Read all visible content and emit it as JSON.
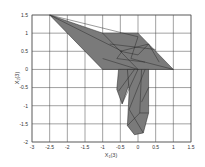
{
  "chart_data": {
    "type": "area",
    "title": "",
    "xlabel": "X1(3)",
    "ylabel": "X2(3)",
    "xlim": [
      -3,
      1.5
    ],
    "ylim": [
      -2,
      1.5
    ],
    "grid": true,
    "legend": "none",
    "x_ticks": [
      "-3",
      "-2.5",
      "-2",
      "-1.5",
      "-1",
      "-0.5",
      "0",
      "0.5",
      "1",
      "1.5"
    ],
    "y_ticks": [
      "1.5",
      "1",
      "0.5",
      "0",
      "-0.5",
      "-1",
      "-1.5",
      "-2"
    ],
    "fill_color": "#7a7a7a",
    "edge_color": "#222222",
    "regions": [
      {
        "name": "upper-wing",
        "points": [
          [
            -2.5,
            1.5
          ],
          [
            -1,
            1
          ],
          [
            0,
            1
          ],
          [
            1,
            0
          ],
          [
            -1,
            0
          ]
        ]
      },
      {
        "name": "lower-left-lobe",
        "points": [
          [
            -0.55,
            0
          ],
          [
            -0.1,
            0
          ],
          [
            -0.45,
            -0.95
          ],
          [
            -0.6,
            -0.55
          ]
        ]
      },
      {
        "name": "lower-right-lobe",
        "points": [
          [
            -0.3,
            0
          ],
          [
            0.3,
            0
          ],
          [
            0.3,
            -1.2
          ],
          [
            0.15,
            -1.75
          ],
          [
            -0.1,
            -1.8
          ],
          [
            -0.3,
            -1.55
          ],
          [
            -0.25,
            -0.6
          ]
        ]
      }
    ],
    "mesh_lines": [
      [
        [
          -2.5,
          1.5
        ],
        [
          0,
          0.9
        ]
      ],
      [
        [
          -2.5,
          1.5
        ],
        [
          -0.45,
          0.5
        ]
      ],
      [
        [
          -1,
          1
        ],
        [
          -0.5,
          0.5
        ]
      ],
      [
        [
          -0.5,
          0.5
        ],
        [
          0,
          0
        ]
      ],
      [
        [
          -0.8,
          0.7
        ],
        [
          0.5,
          0.55
        ]
      ],
      [
        [
          -0.5,
          0.5
        ],
        [
          0.3,
          0.7
        ]
      ],
      [
        [
          -0.6,
          0.3
        ],
        [
          0.2,
          0.2
        ]
      ],
      [
        [
          0,
          0.9
        ],
        [
          -0.2,
          0.3
        ]
      ],
      [
        [
          -0.2,
          0.3
        ],
        [
          1,
          0
        ]
      ],
      [
        [
          0.3,
          0.7
        ],
        [
          0.6,
          0.2
        ]
      ],
      [
        [
          -0.5,
          0.5
        ],
        [
          0,
          0.4
        ]
      ],
      [
        [
          0,
          0.4
        ],
        [
          0.3,
          0.7
        ]
      ],
      [
        [
          -1,
          0.3
        ],
        [
          0,
          0
        ]
      ],
      [
        [
          -0.45,
          0.5
        ],
        [
          -0.6,
          0.3
        ]
      ],
      [
        [
          -0.1,
          0
        ],
        [
          -0.55,
          -0.6
        ]
      ],
      [
        [
          0,
          0
        ],
        [
          -0.45,
          -0.95
        ]
      ],
      [
        [
          0.1,
          0
        ],
        [
          0.05,
          -1.2
        ]
      ],
      [
        [
          0.2,
          0
        ],
        [
          -0.25,
          -1.1
        ]
      ],
      [
        [
          -0.25,
          -1.1
        ],
        [
          0.15,
          -1.75
        ]
      ],
      [
        [
          0.05,
          -1.2
        ],
        [
          0.3,
          -1.2
        ]
      ],
      [
        [
          0.05,
          -1.2
        ],
        [
          -0.3,
          -1.55
        ]
      ],
      [
        [
          0.3,
          -0.5
        ],
        [
          0.1,
          -0.9
        ]
      ]
    ]
  }
}
